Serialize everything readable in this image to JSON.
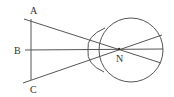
{
  "diagram": {
    "labels": {
      "A": "A",
      "B": "B",
      "C": "C",
      "N": "N"
    },
    "colors": {
      "line": "#555555",
      "text": "#333333",
      "background": "#ffffff"
    },
    "geometry": {
      "object_line": {
        "x": 31,
        "y1": 19,
        "y2": 80
      },
      "eye_center": [
        131,
        50
      ],
      "eye_radius": 32,
      "nodal_point": [
        119,
        49
      ]
    }
  }
}
